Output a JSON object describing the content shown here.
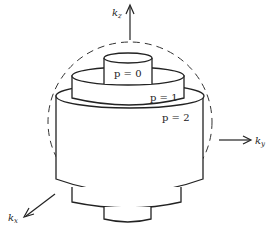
{
  "diagram": {
    "axes": {
      "kz": {
        "base": "k",
        "sub": "z"
      },
      "ky": {
        "base": "k",
        "sub": "y"
      },
      "kx": {
        "base": "k",
        "sub": "x"
      }
    },
    "cylinders": [
      {
        "label": "p = 0",
        "p": 0
      },
      {
        "label": "p = 1",
        "p": 1
      },
      {
        "label": "p = 2",
        "p": 2
      }
    ],
    "sphere": {
      "style": "dashed"
    },
    "colors": {
      "stroke": "#222222",
      "background": "#ffffff"
    }
  }
}
